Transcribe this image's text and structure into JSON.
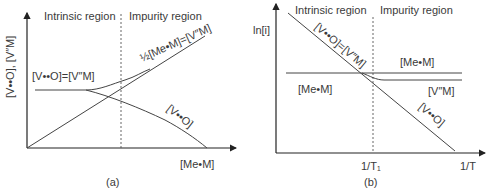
{
  "panel_a": {
    "caption": "(a)",
    "region_left": "Intrinsic region",
    "region_right": "Impurity region",
    "y_axis_label": "[V••O], [V″M]",
    "x_axis_label": "[Me•M]",
    "label_plateau": "[V••O]=[V″M]",
    "label_upper": "½[Me•M]=[V″M]",
    "label_lower": "[V••O]"
  },
  "panel_b": {
    "caption": "(b)",
    "region_left": "Intrinsic region",
    "region_right": "Impurity region",
    "y_axis_label": "ln[i]",
    "x_axis_label": "1/T",
    "x_tick_label": "1/T₁",
    "label_diag_upper": "[V••O]=[V″M]",
    "label_me_right": "[Me•M]",
    "label_me_left": "[Me•M]",
    "label_vm": "[V″M]",
    "label_diag_lower": "[V••O]"
  }
}
